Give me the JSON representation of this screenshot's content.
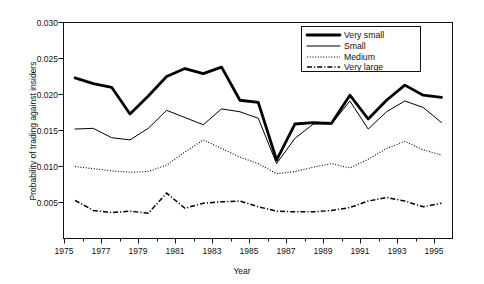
{
  "chart_data": {
    "type": "line",
    "title": "",
    "xlabel": "Year",
    "ylabel": "Probability of trading against insiders",
    "xlim": [
      1974.4,
      1995.6
    ],
    "ylim": [
      0.0,
      0.03
    ],
    "xticks": [
      1975,
      1977,
      1979,
      1981,
      1983,
      1985,
      1987,
      1989,
      1991,
      1993,
      1995
    ],
    "xtick_labels": [
      "1975",
      "1977",
      "1979",
      "1981",
      "1983",
      "1985",
      "1987",
      "1989",
      "1991",
      "1993",
      "1995"
    ],
    "xminor_ticks": [
      1976,
      1978,
      1980,
      1982,
      1984,
      1986,
      1988,
      1990,
      1992,
      1994
    ],
    "yticks": [
      0.005,
      0.01,
      0.015,
      0.02,
      0.025,
      0.03
    ],
    "ytick_labels": [
      "0.005",
      "0.010",
      "0.015",
      "0.020",
      "0.025",
      "0.030"
    ],
    "grid": false,
    "legend_position": "top-right",
    "x": [
      1975,
      1976,
      1977,
      1978,
      1979,
      1980,
      1981,
      1982,
      1983,
      1984,
      1985,
      1986,
      1987,
      1988,
      1989,
      1990,
      1991,
      1992,
      1993,
      1994,
      1995
    ],
    "series": [
      {
        "name": "Very small",
        "style": "thick-solid",
        "color": "#000000",
        "values": [
          0.0223,
          0.0215,
          0.021,
          0.0173,
          0.0198,
          0.0225,
          0.0236,
          0.0229,
          0.0238,
          0.0192,
          0.0189,
          0.0109,
          0.0159,
          0.0161,
          0.016,
          0.0199,
          0.0166,
          0.0192,
          0.0213,
          0.0199,
          0.0196
        ]
      },
      {
        "name": "Small",
        "style": "thin-solid",
        "color": "#000000",
        "values": [
          0.0152,
          0.0153,
          0.014,
          0.0137,
          0.0153,
          0.0178,
          0.0168,
          0.0158,
          0.018,
          0.0176,
          0.0167,
          0.0104,
          0.0139,
          0.0159,
          0.0159,
          0.0191,
          0.0152,
          0.0176,
          0.0191,
          0.0182,
          0.0161
        ]
      },
      {
        "name": "Medium",
        "style": "dotted",
        "color": "#000000",
        "values": [
          0.01,
          0.0097,
          0.0094,
          0.0092,
          0.0093,
          0.0102,
          0.012,
          0.0137,
          0.0125,
          0.0113,
          0.0104,
          0.009,
          0.0093,
          0.0099,
          0.0104,
          0.0098,
          0.011,
          0.0125,
          0.0135,
          0.0123,
          0.0116
        ]
      },
      {
        "name": "Very large",
        "style": "dash-dot",
        "color": "#000000",
        "values": [
          0.0053,
          0.0039,
          0.0036,
          0.0038,
          0.0035,
          0.0063,
          0.0042,
          0.0049,
          0.0051,
          0.0052,
          0.0044,
          0.0038,
          0.0037,
          0.0037,
          0.0039,
          0.0043,
          0.0052,
          0.0057,
          0.0052,
          0.0044,
          0.0049
        ]
      }
    ]
  },
  "legend": {
    "entries": [
      {
        "label": "Very small"
      },
      {
        "label": "Small"
      },
      {
        "label": "Medium"
      },
      {
        "label": "Very large"
      }
    ]
  }
}
